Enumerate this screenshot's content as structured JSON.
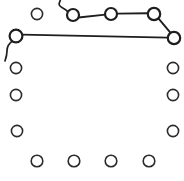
{
  "figure": {
    "canvas": {
      "width": 184,
      "height": 181,
      "background": "#ffffff"
    },
    "stroke_color": "#1e1e1e",
    "node_fill": "#ffffff",
    "node_label": "node",
    "edge_label": "edge",
    "nodes": [
      {
        "id": "n1",
        "name": "node-top-1",
        "cx": 37,
        "cy": 14,
        "r": 5.6,
        "emphasis": "normal"
      },
      {
        "id": "n2",
        "name": "node-top-2",
        "cx": 73,
        "cy": 15,
        "r": 6.0,
        "emphasis": "thick"
      },
      {
        "id": "n3",
        "name": "node-top-3",
        "cx": 111,
        "cy": 14,
        "r": 6.0,
        "emphasis": "thick"
      },
      {
        "id": "n4",
        "name": "node-top-4",
        "cx": 154,
        "cy": 14,
        "r": 6.2,
        "emphasis": "thick"
      },
      {
        "id": "n5",
        "name": "node-right-top",
        "cx": 174,
        "cy": 38,
        "r": 6.2,
        "emphasis": "thick"
      },
      {
        "id": "n6",
        "name": "node-left-top",
        "cx": 16,
        "cy": 36,
        "r": 6.4,
        "emphasis": "thick"
      },
      {
        "id": "n7",
        "name": "node-left-1",
        "cx": 16,
        "cy": 68,
        "r": 5.6,
        "emphasis": "normal"
      },
      {
        "id": "n8",
        "name": "node-left-2",
        "cx": 16,
        "cy": 95,
        "r": 5.6,
        "emphasis": "normal"
      },
      {
        "id": "n9",
        "name": "node-left-3",
        "cx": 17,
        "cy": 131,
        "r": 5.6,
        "emphasis": "normal"
      },
      {
        "id": "n10",
        "name": "node-right-1",
        "cx": 173,
        "cy": 68,
        "r": 5.6,
        "emphasis": "normal"
      },
      {
        "id": "n11",
        "name": "node-right-2",
        "cx": 173,
        "cy": 95,
        "r": 5.6,
        "emphasis": "normal"
      },
      {
        "id": "n12",
        "name": "node-right-3",
        "cx": 173,
        "cy": 131,
        "r": 5.6,
        "emphasis": "normal"
      },
      {
        "id": "n13",
        "name": "node-bottom-1",
        "cx": 37,
        "cy": 161,
        "r": 5.8,
        "emphasis": "normal"
      },
      {
        "id": "n14",
        "name": "node-bottom-2",
        "cx": 74,
        "cy": 161,
        "r": 5.8,
        "emphasis": "normal"
      },
      {
        "id": "n15",
        "name": "node-bottom-3",
        "cx": 111,
        "cy": 161,
        "r": 5.8,
        "emphasis": "normal"
      },
      {
        "id": "n16",
        "name": "node-bottom-4",
        "cx": 149,
        "cy": 161,
        "r": 5.8,
        "emphasis": "normal"
      }
    ],
    "edges": [
      {
        "id": "e1",
        "name": "edge-tail-to-node-top-2",
        "d": "M 60 -4 C 62 2, 57 3, 60 6 C 63 9, 66 9, 68 12"
      },
      {
        "id": "e2",
        "name": "edge-node-top-2-to-node-top-3",
        "d": "M 78.5 17.5 L 105.4 14.6"
      },
      {
        "id": "e3",
        "name": "edge-node-top-3-to-node-top-4",
        "d": "M 117 13.6 L 147.9 13.2"
      },
      {
        "id": "e4",
        "name": "edge-node-top-4-to-node-right-top",
        "d": "M 158.6 18.6 L 170.6 32.8"
      },
      {
        "id": "e5",
        "name": "edge-node-left-top-to-node-right-top",
        "d": "M 22.2 34.6 L 168.2 37.6"
      },
      {
        "id": "e6",
        "name": "edge-node-left-top-hook-tail",
        "d": "M 12.6 41 C 8 44, 7 47, 7 51 C 7 55, 6 58, 5 61"
      }
    ]
  }
}
